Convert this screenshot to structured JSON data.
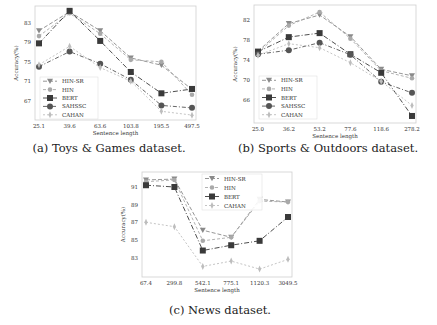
{
  "colors": {
    "hin_sr": "#8a8a8a",
    "hin": "#a9a9a9",
    "bert": "#3a3a3a",
    "sahssc": "#555555",
    "cahan": "#bdbdbd",
    "frame": "#cfcfcf"
  },
  "chart_data": [
    {
      "type": "line",
      "title": "",
      "caption": "(a) Toys & Games dataset.",
      "xlabel": "Sentence length",
      "ylabel": "Accuracy(%)",
      "categories": [
        "25.1",
        "39.6",
        "63.6",
        "103.8",
        "195.5",
        "497.5"
      ],
      "yticks": [
        67,
        71,
        75,
        79,
        83
      ],
      "ylim": [
        63,
        86.5
      ],
      "grid": false,
      "legend_position": "lower left",
      "series": [
        {
          "name": "HIN-SR",
          "marker": "triangle-down",
          "values": [
            81.4,
            85.3,
            81.4,
            75.8,
            74.3,
            69.3
          ]
        },
        {
          "name": "HIN",
          "marker": "circle-small",
          "values": [
            80.3,
            85.0,
            80.8,
            75.4,
            75.0,
            68.2
          ]
        },
        {
          "name": "BERT",
          "marker": "square",
          "values": [
            78.8,
            85.5,
            79.3,
            72.9,
            68.5,
            69.4
          ]
        },
        {
          "name": "SAHSSC",
          "marker": "circle",
          "values": [
            74.0,
            77.1,
            74.6,
            71.3,
            66.0,
            65.5
          ]
        },
        {
          "name": "CAHAN",
          "marker": "diamond-thin",
          "values": [
            74.4,
            78.2,
            73.8,
            71.0,
            64.8,
            64.0
          ]
        }
      ]
    },
    {
      "type": "line",
      "title": "",
      "caption": "(b) Sports & Outdoors dataset.",
      "xlabel": "Sentence length",
      "ylabel": "Accuracy(%)",
      "categories": [
        "25.0",
        "36.2",
        "53.2",
        "77.6",
        "118.6",
        "278.2"
      ],
      "yticks": [
        66,
        70,
        74,
        78,
        82
      ],
      "ylim": [
        61.5,
        85
      ],
      "grid": false,
      "legend_position": "lower left",
      "series": [
        {
          "name": "HIN-SR",
          "marker": "triangle-down",
          "values": [
            75.8,
            81.3,
            83.0,
            78.7,
            72.2,
            70.9
          ]
        },
        {
          "name": "HIN",
          "marker": "circle-small",
          "values": [
            75.5,
            80.9,
            83.6,
            78.3,
            71.9,
            70.4
          ]
        },
        {
          "name": "BERT",
          "marker": "square",
          "values": [
            75.7,
            78.6,
            79.4,
            75.2,
            71.5,
            62.9
          ]
        },
        {
          "name": "SAHSSC",
          "marker": "circle",
          "values": [
            75.2,
            76.0,
            77.5,
            75.1,
            69.7,
            67.5
          ]
        },
        {
          "name": "CAHAN",
          "marker": "diamond-thin",
          "values": [
            75.0,
            77.3,
            76.5,
            73.5,
            69.8,
            65.0
          ]
        }
      ]
    },
    {
      "type": "line",
      "title": "",
      "caption": "(c) News dataset.",
      "xlabel": "Sentence length",
      "ylabel": "Accuracy(%)",
      "categories": [
        "67.4",
        "299.8",
        "542.1",
        "775.1",
        "1120.3",
        "3049.5"
      ],
      "yticks": [
        83,
        85,
        87,
        89,
        91
      ],
      "ylim": [
        80.8,
        92.7
      ],
      "grid": false,
      "legend_position": "upper center",
      "series": [
        {
          "name": "HIN-SR",
          "marker": "triangle-down",
          "values": [
            91.8,
            91.9,
            86.1,
            85.3,
            89.6,
            89.3
          ]
        },
        {
          "name": "HIN",
          "marker": "circle-small",
          "values": [
            91.6,
            91.8,
            84.9,
            85.3,
            89.4,
            89.3
          ]
        },
        {
          "name": "BERT",
          "marker": "square",
          "values": [
            91.2,
            91.0,
            83.8,
            84.4,
            84.9,
            87.6
          ]
        },
        {
          "name": "CAHAN",
          "marker": "diamond-thin",
          "values": [
            87.0,
            86.5,
            82.0,
            82.6,
            81.7,
            82.8
          ]
        }
      ]
    }
  ]
}
